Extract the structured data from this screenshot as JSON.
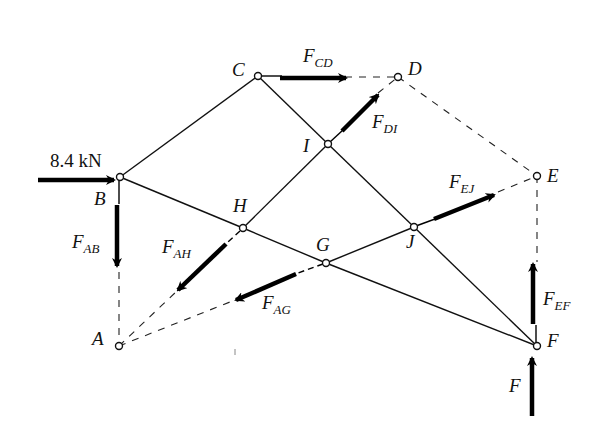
{
  "diagram": {
    "type": "truss-free-body-diagram",
    "applied_load": {
      "label": "8.4 kN",
      "at": "B",
      "direction": "right"
    },
    "nodes": {
      "A": {
        "label": "A",
        "x": 119,
        "y": 346
      },
      "B": {
        "label": "B",
        "x": 120,
        "y": 177
      },
      "C": {
        "label": "C",
        "x": 258,
        "y": 76
      },
      "D": {
        "label": "D",
        "x": 398,
        "y": 77
      },
      "E": {
        "label": "E",
        "x": 537,
        "y": 176
      },
      "F": {
        "label": "F",
        "x": 537,
        "y": 346
      },
      "G": {
        "label": "G",
        "x": 326,
        "y": 263
      },
      "H": {
        "label": "H",
        "x": 243,
        "y": 228
      },
      "I": {
        "label": "I",
        "x": 328,
        "y": 144
      },
      "J": {
        "label": "J",
        "x": 414,
        "y": 227
      }
    },
    "members_solid": [
      [
        "B",
        "C"
      ],
      [
        "C",
        "I"
      ],
      [
        "I",
        "J"
      ],
      [
        "J",
        "F"
      ],
      [
        "B",
        "H"
      ],
      [
        "H",
        "G"
      ],
      [
        "G",
        "F"
      ],
      [
        "H",
        "I"
      ],
      [
        "G",
        "J"
      ]
    ],
    "members_cut_dashed": [
      [
        "C",
        "D"
      ],
      [
        "D",
        "E"
      ],
      [
        "E",
        "F"
      ],
      [
        "A",
        "B"
      ],
      [
        "A",
        "H"
      ],
      [
        "A",
        "G"
      ],
      [
        "D",
        "I"
      ],
      [
        "E",
        "J"
      ]
    ],
    "forces": [
      {
        "name": "F",
        "sub": "CD",
        "label": "F_CD"
      },
      {
        "name": "F",
        "sub": "DI",
        "label": "F_DI"
      },
      {
        "name": "F",
        "sub": "EJ",
        "label": "F_EJ"
      },
      {
        "name": "F",
        "sub": "EF",
        "label": "F_EF"
      },
      {
        "name": "F",
        "sub": "AB",
        "label": "F_AB"
      },
      {
        "name": "F",
        "sub": "AH",
        "label": "F_AH"
      },
      {
        "name": "F",
        "sub": "AG",
        "label": "F_AG"
      },
      {
        "name": "F",
        "sub": "",
        "label": "F"
      }
    ]
  },
  "labels": {
    "load": "8.4 kN",
    "A": "A",
    "B": "B",
    "C": "C",
    "D": "D",
    "E": "E",
    "F": "F",
    "G": "G",
    "H": "H",
    "I": "I",
    "J": "J",
    "f_main": "F",
    "sub_cd": "CD",
    "sub_di": "DI",
    "sub_ej": "EJ",
    "sub_ef": "EF",
    "sub_ab": "AB",
    "sub_ah": "AH",
    "sub_ag": "AG",
    "reaction_f": "F"
  }
}
